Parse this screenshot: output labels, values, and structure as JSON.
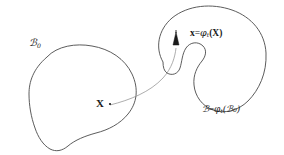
{
  "figure": {
    "background_color": "#ffffff",
    "stroke_color": "#4a4a4a",
    "text_color": "#1a1a1a",
    "width": 284,
    "height": 155
  },
  "labels": {
    "reference_body": {
      "symbol": "ℬ",
      "subscript": "0",
      "full_text": "ℬ₀"
    },
    "reference_point": {
      "symbol": "X",
      "full_text": "X"
    },
    "current_point_map": {
      "full_text": "x = φₜ(X)",
      "lhs": "x",
      "equals": "=",
      "phi": "φ",
      "phi_subscript": "t",
      "argument": "(X)"
    },
    "current_body": {
      "full_text": "ℬ = φₜ(ℬ₀)",
      "lhs": "ℬ",
      "equals": "=",
      "phi": "φ",
      "phi_subscript": "t",
      "argument": "(ℬ₀)"
    }
  },
  "markers": {
    "reference_point_dot": "point-marker",
    "current_point_arrow": "vector-arrow-up"
  }
}
